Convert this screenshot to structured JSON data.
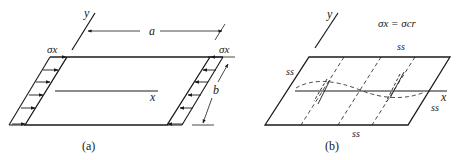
{
  "figure": {
    "panel_a": {
      "caption": "(a)",
      "labels": {
        "y_axis": "y",
        "x_axis": "x",
        "length": "a",
        "width": "b",
        "stress_left": "σx",
        "stress_right": "σx"
      }
    },
    "panel_b": {
      "caption": "(b)",
      "labels": {
        "y_axis": "y",
        "x_axis": "x",
        "condition": "σx = σcr",
        "edge_top": "ss",
        "edge_left": "ss",
        "edge_right": "ss",
        "edge_bottom": "ss"
      }
    }
  }
}
